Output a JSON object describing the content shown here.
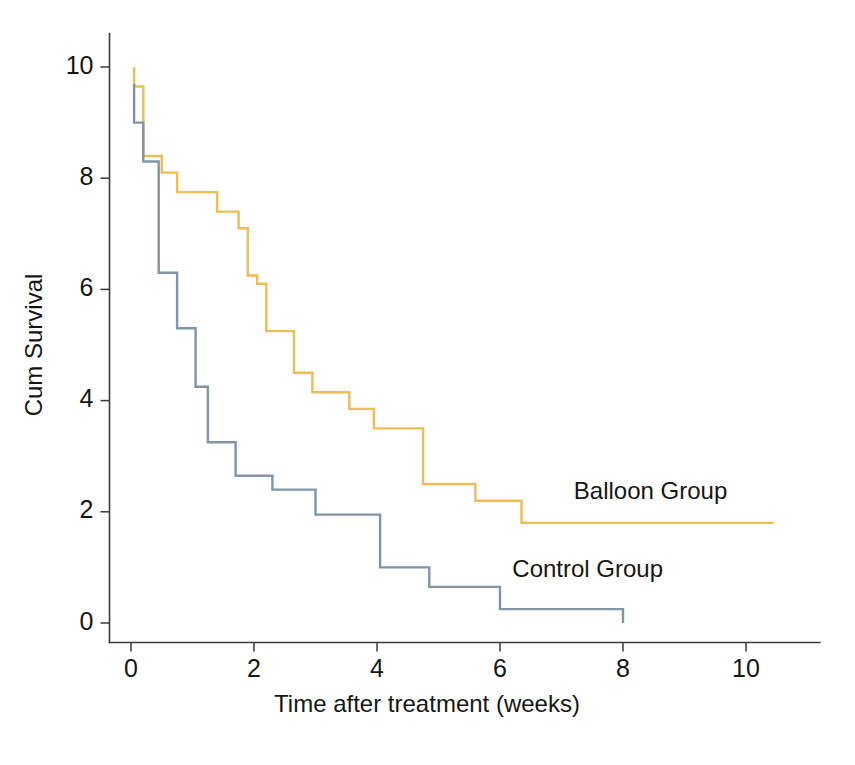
{
  "chart_data": {
    "type": "line",
    "subtype": "kaplan-meier-step",
    "title": "",
    "xlabel": "Time after treatment (weeks)",
    "ylabel": "Cum Survival",
    "xlim": [
      -0.35,
      11.2
    ],
    "ylim": [
      -0.35,
      10.6
    ],
    "xticks": [
      0,
      2,
      4,
      6,
      8,
      10
    ],
    "xtick_labels": [
      "0",
      "2",
      "4",
      "6",
      "8",
      "10"
    ],
    "yticks": [
      0,
      2,
      4,
      6,
      8,
      10
    ],
    "ytick_labels": [
      "0",
      "2",
      "4",
      "6",
      "8",
      "10"
    ],
    "grid": false,
    "legend_position": "inline-annotation",
    "series": [
      {
        "name": "Balloon Group",
        "color": "#f0bc55",
        "annotation_label": "Balloon Group",
        "annotation_x": 7.2,
        "annotation_y": 2.35,
        "points": [
          [
            0.05,
            10.0
          ],
          [
            0.05,
            9.65
          ],
          [
            0.2,
            9.65
          ],
          [
            0.2,
            8.4
          ],
          [
            0.5,
            8.4
          ],
          [
            0.5,
            8.1
          ],
          [
            0.75,
            8.1
          ],
          [
            0.75,
            7.75
          ],
          [
            1.4,
            7.75
          ],
          [
            1.4,
            7.4
          ],
          [
            1.75,
            7.4
          ],
          [
            1.75,
            7.1
          ],
          [
            1.9,
            7.1
          ],
          [
            1.9,
            6.25
          ],
          [
            2.05,
            6.25
          ],
          [
            2.05,
            6.1
          ],
          [
            2.2,
            6.1
          ],
          [
            2.2,
            5.25
          ],
          [
            2.65,
            5.25
          ],
          [
            2.65,
            4.5
          ],
          [
            2.95,
            4.5
          ],
          [
            2.95,
            4.15
          ],
          [
            3.55,
            4.15
          ],
          [
            3.55,
            3.85
          ],
          [
            3.95,
            3.85
          ],
          [
            3.95,
            3.5
          ],
          [
            4.75,
            3.5
          ],
          [
            4.75,
            2.5
          ],
          [
            5.6,
            2.5
          ],
          [
            5.6,
            2.2
          ],
          [
            6.35,
            2.2
          ],
          [
            6.35,
            1.8
          ],
          [
            10.45,
            1.8
          ]
        ]
      },
      {
        "name": "Control Group",
        "color": "#7f95a9",
        "annotation_label": "Control Group",
        "annotation_x": 6.2,
        "annotation_y": 0.95,
        "points": [
          [
            0.05,
            9.7
          ],
          [
            0.05,
            9.0
          ],
          [
            0.2,
            9.0
          ],
          [
            0.2,
            8.3
          ],
          [
            0.45,
            8.3
          ],
          [
            0.45,
            6.3
          ],
          [
            0.75,
            6.3
          ],
          [
            0.75,
            5.3
          ],
          [
            1.05,
            5.3
          ],
          [
            1.05,
            4.25
          ],
          [
            1.25,
            4.25
          ],
          [
            1.25,
            3.25
          ],
          [
            1.7,
            3.25
          ],
          [
            1.7,
            2.65
          ],
          [
            2.3,
            2.65
          ],
          [
            2.3,
            2.4
          ],
          [
            3.0,
            2.4
          ],
          [
            3.0,
            1.95
          ],
          [
            4.05,
            1.95
          ],
          [
            4.05,
            1.0
          ],
          [
            4.85,
            1.0
          ],
          [
            4.85,
            0.65
          ],
          [
            6.0,
            0.65
          ],
          [
            6.0,
            0.25
          ],
          [
            8.0,
            0.25
          ],
          [
            8.0,
            0.0
          ]
        ]
      }
    ]
  },
  "figure": {
    "background_color": "#ffffff",
    "axis_color": "#3a3a3a",
    "text_color": "#161616"
  }
}
